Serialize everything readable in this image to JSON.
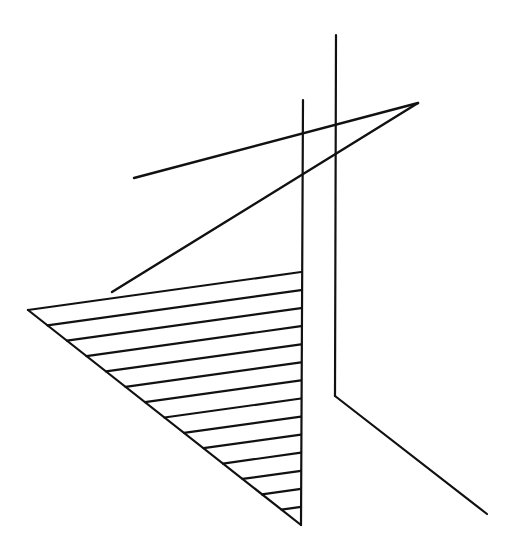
{
  "canvas": {
    "width": 517,
    "height": 544,
    "background": "#ffffff",
    "stroke": "#111111"
  },
  "lines": [
    {
      "name": "vertical-line-left",
      "x1": 303,
      "y1": 100,
      "x2": 301,
      "y2": 525,
      "width": 2.2
    },
    {
      "name": "vertical-line-right",
      "x1": 336,
      "y1": 35,
      "x2": 335,
      "y2": 396,
      "width": 2.2
    },
    {
      "name": "diagonal-line-right",
      "x1": 335,
      "y1": 396,
      "x2": 487,
      "y2": 514,
      "width": 2.2
    },
    {
      "name": "upper-slanted-line",
      "x1": 134,
      "y1": 178,
      "x2": 418,
      "y2": 103,
      "width": 2.4
    },
    {
      "name": "lower-slanted-line",
      "x1": 418,
      "y1": 103,
      "x2": 112,
      "y2": 292,
      "width": 2.4
    },
    {
      "name": "diagonal-line-left",
      "x1": 28,
      "y1": 310,
      "x2": 301,
      "y2": 525,
      "width": 2.2
    }
  ],
  "envelope": {
    "name": "string-art-envelope",
    "diagonal_start": [
      28,
      310
    ],
    "diagonal_end": [
      301,
      525
    ],
    "vertical_start": [
      301,
      272
    ],
    "vertical_end": [
      301,
      525
    ],
    "segments": 14,
    "width": 2.2
  }
}
